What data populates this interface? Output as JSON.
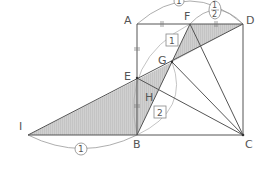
{
  "diagram": {
    "points": {
      "A": {
        "label": "A",
        "x": 137,
        "y": 24
      },
      "D": {
        "label": "D",
        "x": 243,
        "y": 24
      },
      "F": {
        "label": "F",
        "x": 190,
        "y": 24
      },
      "B": {
        "label": "B",
        "x": 137,
        "y": 135
      },
      "C": {
        "label": "C",
        "x": 243,
        "y": 135
      },
      "E": {
        "label": "E",
        "x": 137,
        "y": 78
      },
      "G": {
        "label": "G",
        "x": 172,
        "y": 62
      },
      "H": {
        "label": "H",
        "x": 153,
        "y": 98
      },
      "I": {
        "label": "I",
        "x": 28,
        "y": 135
      }
    },
    "arc_labels": {
      "top_AD": "1",
      "top_FD": "1/2",
      "frac_num": "1",
      "frac_den": "2",
      "bottom_IB": "1"
    },
    "box_labels": {
      "FG": "1",
      "GB": "2"
    },
    "colors": {
      "line": "#555555",
      "shade": "#cccccc",
      "arc": "#999999"
    }
  }
}
